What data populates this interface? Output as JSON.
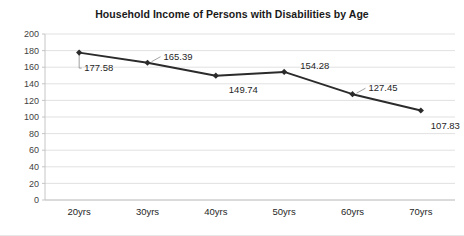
{
  "chart_data": {
    "type": "line",
    "title": "Household Income of Persons with Disabilities by Age",
    "xlabel": "",
    "ylabel": "",
    "categories": [
      "20yrs",
      "30yrs",
      "40yrs",
      "50yrs",
      "60yrs",
      "70yrs"
    ],
    "values": [
      177.58,
      165.39,
      149.74,
      154.28,
      127.45,
      107.83
    ],
    "data_labels": [
      "177.58",
      "165.39",
      "149.74",
      "154.28",
      "127.45",
      "107.83"
    ],
    "ylim": [
      0,
      200
    ],
    "ytick_labels": [
      "200",
      "180",
      "160",
      "140",
      "120",
      "100",
      "80",
      "60",
      "40",
      "20",
      "0"
    ],
    "ytick_values": [
      200,
      180,
      160,
      140,
      120,
      100,
      80,
      60,
      40,
      20,
      0
    ],
    "grid": "horizontal",
    "legend": "none",
    "series_color": "#2b2b2b",
    "gridline_color": "#d9d9d9",
    "marker": "diamond",
    "label_leader_lines": true
  }
}
